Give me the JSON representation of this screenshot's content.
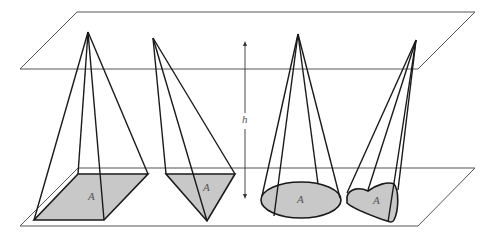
{
  "figure": {
    "height_label": "h",
    "base_label": "A",
    "colors": {
      "plane_stroke": "#555555",
      "edge_stroke": "#1a1a1a",
      "base_fill": "#c8c8c8",
      "label": "#555555"
    },
    "solids": [
      {
        "name": "square pyramid",
        "base_label": "A"
      },
      {
        "name": "triangular pyramid",
        "base_label": "A"
      },
      {
        "name": "cone",
        "base_label": "A"
      },
      {
        "name": "oblique cone with irregular base",
        "base_label": "A"
      }
    ]
  }
}
